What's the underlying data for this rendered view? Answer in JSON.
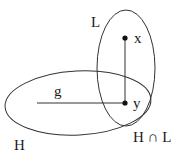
{
  "diagram": {
    "sets": [
      {
        "id": "L",
        "label": "L"
      },
      {
        "id": "H",
        "label": "H"
      }
    ],
    "points": [
      {
        "id": "x",
        "label": "x"
      },
      {
        "id": "y",
        "label": "y"
      }
    ],
    "line": {
      "label": "g"
    },
    "intersection": {
      "label": "H ∩ L"
    },
    "colors": {
      "stroke": "#333333",
      "text": "#1a1a1a",
      "background": "#ffffff"
    }
  }
}
